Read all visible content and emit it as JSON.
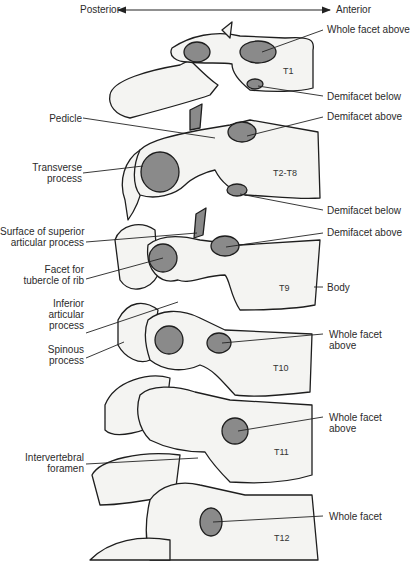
{
  "orientation": {
    "left": "Posterior",
    "right": "Anterior"
  },
  "colors": {
    "bone_fill": "#f4f4f2",
    "facet_fill": "#8a8a8a",
    "outline": "#1e1e1e",
    "label_text": "#2b2b2b"
  },
  "vertebrae": [
    {
      "id": "T1",
      "label": "T1"
    },
    {
      "id": "T2-T8",
      "label": "T2-T8"
    },
    {
      "id": "T9",
      "label": "T9"
    },
    {
      "id": "T10",
      "label": "T10"
    },
    {
      "id": "T11",
      "label": "T11"
    },
    {
      "id": "T12",
      "label": "T12"
    }
  ],
  "labels_right": [
    {
      "text": "Whole facet above"
    },
    {
      "text": "Demifacet below"
    },
    {
      "text": "Demifacet above"
    },
    {
      "text": "Demifacet below"
    },
    {
      "text": "Demifacet above"
    },
    {
      "text": "Body"
    },
    {
      "text": "Whole facet",
      "text2": "above"
    },
    {
      "text": "Whole facet",
      "text2": "above"
    },
    {
      "text": "Whole facet"
    }
  ],
  "labels_left": [
    {
      "text": "Pedicle"
    },
    {
      "text": "Transverse",
      "text2": "process"
    },
    {
      "text": "Surface of superior",
      "text2": "articular process"
    },
    {
      "text": "Facet for",
      "text2": "tubercle of rib"
    },
    {
      "text": "Inferior",
      "text2": "articular",
      "text3": "process"
    },
    {
      "text": "Spinous",
      "text2": "process"
    },
    {
      "text": "Intervertebral",
      "text2": "foramen"
    }
  ]
}
